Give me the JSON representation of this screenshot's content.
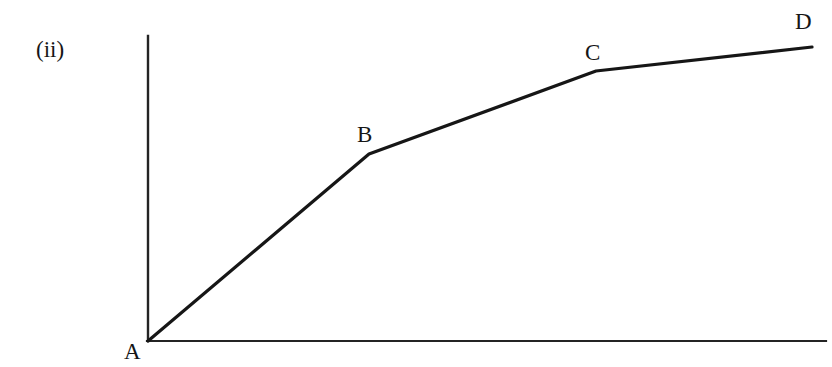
{
  "figure": {
    "number_label": "(ii)",
    "background_color": "#ffffff",
    "ink_color": "#161616",
    "width": 832,
    "height": 367
  },
  "axes": {
    "y_axis_name": "y-axis",
    "x_axis_name": "x-axis",
    "origin": {
      "x": 148,
      "y": 341
    },
    "y_axis_top": {
      "x": 147,
      "y": 36
    },
    "x_axis_right": {
      "x": 826,
      "y": 341
    },
    "stroke_width": 2,
    "color": "#242424",
    "tick_labels": [],
    "x_axis_title": "",
    "y_axis_title": ""
  },
  "curve": {
    "name": "piecewise-linear-curve",
    "stroke_width": 3,
    "color": "#161616",
    "point_labels": [
      "A",
      "B",
      "C",
      "D"
    ],
    "points_px": [
      {
        "label": "A",
        "x": 148,
        "y": 341
      },
      {
        "label": "B",
        "x": 369,
        "y": 154
      },
      {
        "label": "C",
        "x": 596,
        "y": 71
      },
      {
        "label": "D",
        "x": 812,
        "y": 47
      }
    ]
  },
  "chart_data": {
    "type": "line",
    "title": "(ii)",
    "xlabel": "",
    "ylabel": "",
    "grid": false,
    "legend": null,
    "axis_ticks": false,
    "series": [
      {
        "name": "piecewise-linear-curve",
        "point_labels": [
          "A",
          "B",
          "C",
          "D"
        ],
        "x": [
          0.0,
          0.326,
          0.661,
          0.979
        ],
        "y": [
          0.0,
          0.613,
          0.885,
          0.964
        ],
        "segments": [
          {
            "from": "A",
            "to": "B",
            "slope": "steepest"
          },
          {
            "from": "B",
            "to": "C",
            "slope": "moderate"
          },
          {
            "from": "C",
            "to": "D",
            "slope": "shallow"
          }
        ]
      }
    ],
    "xlim": [
      0,
      1
    ],
    "ylim": [
      0,
      1
    ],
    "annotations": [
      {
        "text": "A",
        "x": 0.0,
        "y": 0.0,
        "position": "below-left"
      },
      {
        "text": "B",
        "x": 0.326,
        "y": 0.613,
        "position": "above-left"
      },
      {
        "text": "C",
        "x": 0.661,
        "y": 0.885,
        "position": "above"
      },
      {
        "text": "D",
        "x": 0.979,
        "y": 0.964,
        "position": "above"
      },
      {
        "text": "(ii)",
        "x": -0.16,
        "y": 0.99,
        "position": "outside-left"
      }
    ]
  }
}
